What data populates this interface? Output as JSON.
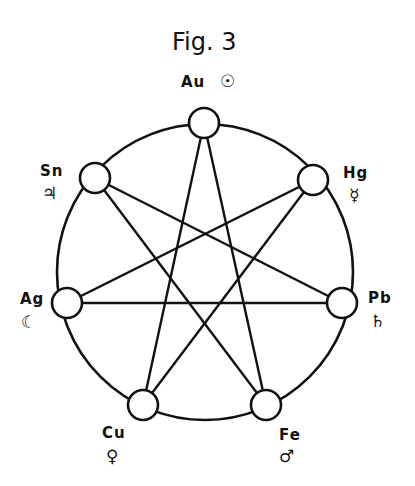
{
  "figure": {
    "title": "Fig. 3",
    "ink_color": "#111111",
    "background": "#ffffff"
  },
  "nodes": [
    {
      "id": "au",
      "element": "Au",
      "symbol": "☉",
      "symbol_name": "sun-icon",
      "x": 204,
      "y": 123
    },
    {
      "id": "hg",
      "element": "Hg",
      "symbol": "☿",
      "symbol_name": "mercury-icon",
      "x": 313,
      "y": 180
    },
    {
      "id": "pb",
      "element": "Pb",
      "symbol": "♄",
      "symbol_name": "saturn-icon",
      "x": 342,
      "y": 303
    },
    {
      "id": "fe",
      "element": "Fe",
      "symbol": "♂",
      "symbol_name": "mars-icon",
      "x": 266,
      "y": 405
    },
    {
      "id": "cu",
      "element": "Cu",
      "symbol": "♀",
      "symbol_name": "venus-icon",
      "x": 143,
      "y": 405
    },
    {
      "id": "ag",
      "element": "Ag",
      "symbol": "☾",
      "symbol_name": "moon-icon",
      "x": 67,
      "y": 303
    },
    {
      "id": "sn",
      "element": "Sn",
      "symbol": "♃",
      "symbol_name": "jupiter-icon",
      "x": 95,
      "y": 178
    }
  ],
  "edges": [
    [
      "Au",
      "Fe"
    ],
    [
      "Au",
      "Cu"
    ],
    [
      "Hg",
      "Cu"
    ],
    [
      "Hg",
      "Ag"
    ],
    [
      "Pb",
      "Ag"
    ],
    [
      "Pb",
      "Sn"
    ],
    [
      "Fe",
      "Sn"
    ]
  ],
  "outer_circle": {
    "cx": 205,
    "cy": 272,
    "r": 148
  }
}
